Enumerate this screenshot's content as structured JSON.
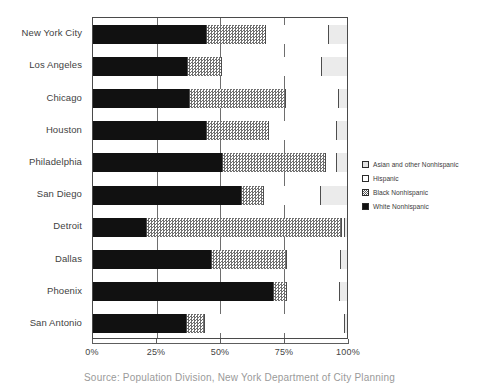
{
  "caption": "Source: Population Division, New York Department of City Planning",
  "legend": {
    "position": "right",
    "items": [
      {
        "label": "Asian and other Nonhispanic",
        "icon": "square-swatch-icon",
        "key": "asian",
        "color": "#e3e3e3"
      },
      {
        "label": "Hispanic",
        "icon": "square-swatch-icon",
        "key": "hispanic",
        "color": "#ffffff"
      },
      {
        "label": "Black Nonhispanic",
        "icon": "square-swatch-icon",
        "key": "black_nh",
        "color": "#808080"
      },
      {
        "label": "White Nonhispanic",
        "icon": "square-swatch-icon",
        "key": "white_nh",
        "color": "#111111"
      }
    ]
  },
  "chart_data": {
    "type": "bar",
    "orientation": "horizontal",
    "stacked": true,
    "stack_mode": "percent",
    "title": "",
    "xlabel": "",
    "ylabel": "",
    "xlim": [
      0,
      100
    ],
    "xticks": [
      0,
      25,
      50,
      75,
      100
    ],
    "xticklabels": [
      "0%",
      "25%",
      "50%",
      "75%",
      "100%"
    ],
    "grid": true,
    "legend_position": "right",
    "categories": [
      "New York City",
      "Los Angeles",
      "Chicago",
      "Houston",
      "Philadelphia",
      "San Diego",
      "Detroit",
      "Dallas",
      "Phoenix",
      "San Antonio"
    ],
    "series": [
      {
        "name": "White Nonhispanic",
        "key": "white_nh",
        "values": [
          44.7,
          37.3,
          38.0,
          44.7,
          51.0,
          58.8,
          21.2,
          46.7,
          71.4,
          36.9
        ]
      },
      {
        "name": "Black Nonhispanic",
        "key": "black_nh",
        "values": [
          23.5,
          13.3,
          38.0,
          24.7,
          40.8,
          8.6,
          76.9,
          29.8,
          5.1,
          7.1
        ]
      },
      {
        "name": "Hispanic",
        "key": "hispanic",
        "values": [
          24.7,
          39.6,
          20.8,
          26.7,
          4.3,
          22.4,
          1.2,
          21.2,
          20.8,
          55.2
        ]
      },
      {
        "name": "Asian and other Nonhispanic",
        "key": "asian",
        "values": [
          7.1,
          9.8,
          3.2,
          3.9,
          3.9,
          10.2,
          0.7,
          2.3,
          2.7,
          0.8
        ]
      }
    ]
  }
}
